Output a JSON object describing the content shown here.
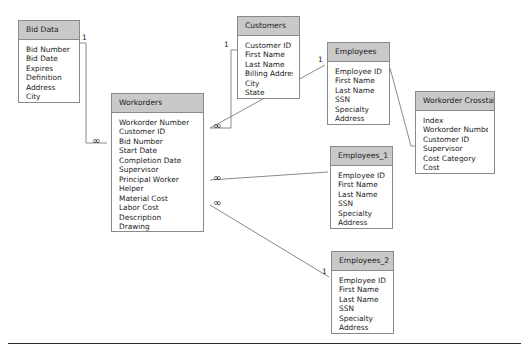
{
  "diagram": {
    "entities": [
      {
        "id": "bid-data",
        "name": "Bid Data",
        "fields": [
          "Bid Number",
          "Bid Date",
          "Expires",
          "Definition",
          "Address",
          "City"
        ],
        "x": 18,
        "y": 20,
        "width": 62,
        "height": 83
      },
      {
        "id": "workorders",
        "name": "Workorders",
        "fields": [
          "Workorder Number",
          "Customer ID",
          "Bid Number",
          "Start Date",
          "Completion Date",
          "Supervisor",
          "Principal Worker",
          "Helper",
          "Material Cost",
          "Labor Cost",
          "Description",
          "Drawing"
        ],
        "x": 111,
        "y": 93,
        "width": 93,
        "height": 139
      },
      {
        "id": "customers",
        "name": "Customers",
        "fields": [
          "Customer ID",
          "First Name",
          "Last Name",
          "Billing Address",
          "City",
          "State"
        ],
        "x": 237,
        "y": 16,
        "width": 63,
        "height": 83
      },
      {
        "id": "employees",
        "name": "Employees",
        "fields": [
          "Employee ID",
          "First Name",
          "Last Name",
          "SSN",
          "Specialty",
          "Address"
        ],
        "x": 327,
        "y": 42,
        "width": 63,
        "height": 83
      },
      {
        "id": "employees-1",
        "name": "Employees_1",
        "fields": [
          "Employee ID",
          "First Name",
          "Last Name",
          "SSN",
          "Specialty",
          "Address"
        ],
        "x": 330,
        "y": 146,
        "width": 63,
        "height": 83
      },
      {
        "id": "employees-2",
        "name": "Employees_2",
        "fields": [
          "Employee ID",
          "First Name",
          "Last Name",
          "SSN",
          "Specialty",
          "Address"
        ],
        "x": 331,
        "y": 251,
        "width": 63,
        "height": 83
      },
      {
        "id": "workorder-crosstab",
        "name": "Workorder Crosstab",
        "fields": [
          "Index",
          "Workorder Number",
          "Customer ID",
          "Supervisor",
          "Cost Category",
          "Cost"
        ],
        "x": 415,
        "y": 91,
        "width": 80,
        "height": 83
      }
    ],
    "relationships": [
      {
        "id": "bid-data-to-workorders",
        "from": "bid-data",
        "to": "workorders",
        "from_cardinality": "1",
        "to_cardinality": "∞",
        "path": "M 80 43 L 86 43 L 86 143 L 107 143"
      },
      {
        "id": "customers-to-workorders",
        "from": "customers",
        "to": "workorders",
        "from_cardinality": "1",
        "to_cardinality": "∞",
        "path": "M 237 50 L 231 50 L 231 128 L 210 128"
      },
      {
        "id": "workorders-to-employees",
        "from": "workorders",
        "to": "employees",
        "from_cardinality": "∞",
        "to_cardinality": "1",
        "path": "M 210 128 L 325 65"
      },
      {
        "id": "workorders-to-employees-1",
        "from": "workorders",
        "to": "employees-1",
        "from_cardinality": "∞",
        "to_cardinality": "1",
        "path": "M 210 180 L 328 172"
      },
      {
        "id": "workorders-to-employees-2",
        "from": "workorders",
        "to": "employees-2",
        "from_cardinality": "∞",
        "to_cardinality": "1",
        "path": "M 210 205 L 329 277"
      },
      {
        "id": "employees-to-workorder-crosstab",
        "from": "employees",
        "to": "workorder-crosstab",
        "from_cardinality": "",
        "to_cardinality": "",
        "path": "M 390 68 L 411 146 L 415 146"
      }
    ],
    "cardinality_markers": [
      {
        "id": "bid-data-one",
        "label": "1",
        "x": 82,
        "y": 34
      },
      {
        "id": "workorders-bid-many",
        "label": "∞",
        "x": 92,
        "y": 136
      },
      {
        "id": "customers-one",
        "label": "1",
        "x": 224,
        "y": 41
      },
      {
        "id": "workorders-customer-many",
        "label": "∞",
        "x": 213,
        "y": 121
      },
      {
        "id": "workorders-emp1-many",
        "label": "∞",
        "x": 213,
        "y": 173
      },
      {
        "id": "workorders-emp2-many",
        "label": "∞",
        "x": 213,
        "y": 198
      },
      {
        "id": "employees-one",
        "label": "1",
        "x": 318,
        "y": 56
      },
      {
        "id": "employees-2-one",
        "label": "1",
        "x": 322,
        "y": 268
      }
    ],
    "colors": {
      "header_fill": "#c9c9c9",
      "body_fill": "#ffffff",
      "border": "#8a8a8a",
      "connector": "#8a8a8a",
      "text": "#1a1a1a",
      "rule": "#2b2b2b"
    }
  }
}
